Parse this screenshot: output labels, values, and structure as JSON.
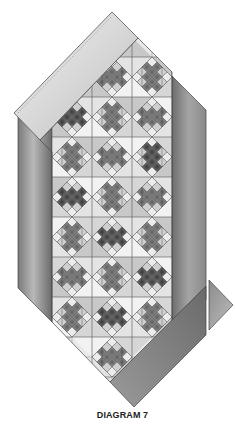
{
  "caption": "DIAGRAM 7",
  "colors": {
    "background": "#ffffff",
    "outline": "#444444",
    "grid_line": "#555555",
    "sashing_light": "#e6e6e6",
    "sashing_mid": "#9a9a9a",
    "sashing_dark": "#6f6f6f",
    "cell_light": "#eeeeee",
    "cell_mid": "#cfcfcf"
  },
  "quilt": {
    "columns": 3,
    "rows": 8,
    "cell_size": 40,
    "blocks": [
      {
        "row": 0,
        "col": 1,
        "shade": "medium"
      },
      {
        "row": 0,
        "col": 2,
        "shade": "medium"
      },
      {
        "row": 1,
        "col": 0,
        "shade": "dark"
      },
      {
        "row": 1,
        "col": 1,
        "shade": "medium"
      },
      {
        "row": 1,
        "col": 2,
        "shade": "medium"
      },
      {
        "row": 2,
        "col": 0,
        "shade": "medium"
      },
      {
        "row": 2,
        "col": 1,
        "shade": "medium"
      },
      {
        "row": 2,
        "col": 2,
        "shade": "dark"
      },
      {
        "row": 3,
        "col": 0,
        "shade": "dark"
      },
      {
        "row": 3,
        "col": 1,
        "shade": "medium"
      },
      {
        "row": 3,
        "col": 2,
        "shade": "medium"
      },
      {
        "row": 4,
        "col": 0,
        "shade": "medium"
      },
      {
        "row": 4,
        "col": 1,
        "shade": "dark"
      },
      {
        "row": 4,
        "col": 2,
        "shade": "medium"
      },
      {
        "row": 5,
        "col": 0,
        "shade": "medium"
      },
      {
        "row": 5,
        "col": 1,
        "shade": "medium"
      },
      {
        "row": 5,
        "col": 2,
        "shade": "dark"
      },
      {
        "row": 6,
        "col": 0,
        "shade": "medium"
      },
      {
        "row": 6,
        "col": 1,
        "shade": "dark"
      },
      {
        "row": 6,
        "col": 2,
        "shade": "medium"
      },
      {
        "row": 7,
        "col": 1,
        "shade": "medium"
      }
    ]
  },
  "border_pieces": [
    "top-left sashing band",
    "left side panel",
    "right side panel",
    "bottom-right sashing band",
    "detached corner triangle"
  ]
}
